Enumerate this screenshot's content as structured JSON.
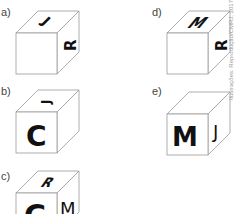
{
  "options": [
    {
      "label": "a)",
      "front": "",
      "top": "J",
      "right": "R"
    },
    {
      "label": "b)",
      "front": "C",
      "top": "J",
      "right": ""
    },
    {
      "label": "c)",
      "front": "C",
      "top": "R",
      "right": "M"
    },
    {
      "label": "d)",
      "front": "",
      "top": "M",
      "right": "R"
    },
    {
      "label": "e)",
      "front": "M",
      "top": "",
      "right": "J"
    }
  ],
  "credit": "Ilustrações: Reprodução/CMRJ, 2017"
}
